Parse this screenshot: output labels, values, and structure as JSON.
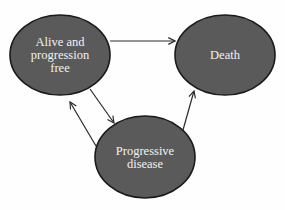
{
  "diagram": {
    "type": "state-transition",
    "colors": {
      "node_fill": "#5a5a5a",
      "node_stroke": "#1a1a1a",
      "edge": "#2a2a2a",
      "label": "#f2f2f2",
      "background": "#fefefe"
    },
    "nodes": [
      {
        "id": "alive",
        "label": "Alive and\nprogression\nfree",
        "cx": 60,
        "cy": 55,
        "rx": 50,
        "ry": 40
      },
      {
        "id": "death",
        "label": "Death",
        "cx": 225,
        "cy": 55,
        "rx": 50,
        "ry": 40
      },
      {
        "id": "progressive",
        "label": "Progressive\ndisease",
        "cx": 145,
        "cy": 157,
        "rx": 50,
        "ry": 41
      }
    ],
    "edges": [
      {
        "from": "alive",
        "to": "death"
      },
      {
        "from": "alive",
        "to": "progressive"
      },
      {
        "from": "progressive",
        "to": "alive"
      },
      {
        "from": "progressive",
        "to": "death"
      }
    ]
  }
}
